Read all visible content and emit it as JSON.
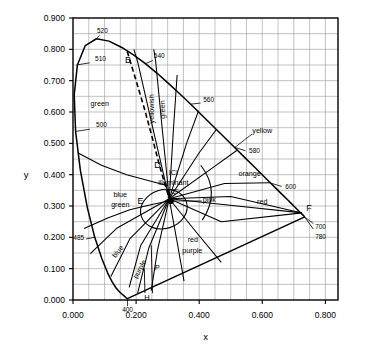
{
  "figure": {
    "kind": "cie-1931-chromaticity-diagram",
    "background": "#ffffff",
    "ink": "#000000",
    "grid_color": "#9a9a9a"
  },
  "axes": {
    "xlabel": "x",
    "ylabel": "y",
    "x_ticklabels": [
      "0.000",
      "0.200",
      "0.400",
      "0.600",
      "0.800"
    ],
    "x_tickvalues": [
      0.0,
      0.2,
      0.4,
      0.6,
      0.8
    ],
    "y_ticklabels": [
      "0.000",
      "0.100",
      "0.200",
      "0.300",
      "0.400",
      "0.500",
      "0.600",
      "0.700",
      "0.800",
      "0.900"
    ],
    "y_tickvalues": [
      0.0,
      0.1,
      0.2,
      0.3,
      0.4,
      0.5,
      0.6,
      0.7,
      0.8,
      0.9
    ],
    "xlim": [
      0.0,
      0.84
    ],
    "ylim": [
      0.0,
      0.9
    ],
    "grid_step": 0.05,
    "grid": true
  },
  "chart_data": {
    "type": "scatter",
    "title": "",
    "xlabel": "x",
    "ylabel": "y",
    "xlim": [
      0.0,
      0.84
    ],
    "ylim": [
      0.0,
      0.9
    ],
    "grid": true,
    "legend_position": "none",
    "spectral_locus": {
      "label": "spectral locus (monochromatic boundary)",
      "points": [
        [
          0.1741,
          0.005
        ],
        [
          0.174,
          0.005
        ],
        [
          0.1738,
          0.0049
        ],
        [
          0.1736,
          0.0049
        ],
        [
          0.1733,
          0.0048
        ],
        [
          0.173,
          0.0048
        ],
        [
          0.1726,
          0.0048
        ],
        [
          0.1721,
          0.0048
        ],
        [
          0.1714,
          0.0051
        ],
        [
          0.1703,
          0.0058
        ],
        [
          0.1689,
          0.0069
        ],
        [
          0.1669,
          0.0086
        ],
        [
          0.1644,
          0.0109
        ],
        [
          0.1611,
          0.0138
        ],
        [
          0.1566,
          0.0177
        ],
        [
          0.151,
          0.0227
        ],
        [
          0.144,
          0.0297
        ],
        [
          0.1355,
          0.0399
        ],
        [
          0.1241,
          0.0578
        ],
        [
          0.1096,
          0.0868
        ],
        [
          0.0913,
          0.1327
        ],
        [
          0.0687,
          0.2007
        ],
        [
          0.0454,
          0.295
        ],
        [
          0.0235,
          0.4127
        ],
        [
          0.0082,
          0.5384
        ],
        [
          0.0039,
          0.6548
        ],
        [
          0.0139,
          0.7502
        ],
        [
          0.0389,
          0.812
        ],
        [
          0.0743,
          0.8338
        ],
        [
          0.1142,
          0.8262
        ],
        [
          0.1547,
          0.8059
        ],
        [
          0.1929,
          0.7816
        ],
        [
          0.2296,
          0.7543
        ],
        [
          0.2658,
          0.7243
        ],
        [
          0.3016,
          0.6923
        ],
        [
          0.3373,
          0.6589
        ],
        [
          0.3731,
          0.6245
        ],
        [
          0.4087,
          0.5896
        ],
        [
          0.4441,
          0.5547
        ],
        [
          0.4788,
          0.5202
        ],
        [
          0.5125,
          0.4866
        ],
        [
          0.5448,
          0.4544
        ],
        [
          0.5752,
          0.4242
        ],
        [
          0.6029,
          0.3965
        ],
        [
          0.627,
          0.3725
        ],
        [
          0.6482,
          0.3514
        ],
        [
          0.6658,
          0.334
        ],
        [
          0.6801,
          0.3197
        ],
        [
          0.6915,
          0.3083
        ],
        [
          0.7006,
          0.2993
        ],
        [
          0.7079,
          0.292
        ],
        [
          0.714,
          0.2859
        ],
        [
          0.719,
          0.2809
        ],
        [
          0.723,
          0.277
        ],
        [
          0.726,
          0.274
        ],
        [
          0.7283,
          0.2717
        ],
        [
          0.73,
          0.27
        ],
        [
          0.7311,
          0.2689
        ],
        [
          0.732,
          0.268
        ],
        [
          0.7327,
          0.2673
        ],
        [
          0.7334,
          0.2666
        ],
        [
          0.734,
          0.266
        ],
        [
          0.7344,
          0.2656
        ],
        [
          0.7346,
          0.2654
        ]
      ]
    },
    "purple_line": {
      "label": "line of purples",
      "from": [
        0.7346,
        0.2654
      ],
      "to": [
        0.1741,
        0.005
      ]
    },
    "points": [
      {
        "name": "illuminant-C",
        "x": 0.31,
        "y": 0.316,
        "marker": "filled-dot",
        "label": "ICI illuminant \"C\""
      },
      {
        "name": "E",
        "x": 0.255,
        "y": 0.316,
        "label": "E"
      },
      {
        "name": "B",
        "x": 0.168,
        "y": 0.79,
        "label": "B"
      },
      {
        "name": "D",
        "x": 0.268,
        "y": 0.43,
        "label": "D"
      },
      {
        "name": "F",
        "x": 0.726,
        "y": 0.278,
        "label": "F"
      },
      {
        "name": "P",
        "x": 0.248,
        "y": 0.105,
        "label": "P"
      },
      {
        "name": "H",
        "x": 0.228,
        "y": 0.028,
        "label": "H"
      }
    ],
    "wavelength_ticks": [
      {
        "nm": "400",
        "x": 0.173,
        "y": 0.005,
        "anchor": "below"
      },
      {
        "nm": "485",
        "x": 0.069,
        "y": 0.2,
        "anchor": "left"
      },
      {
        "nm": "500",
        "x": 0.008,
        "y": 0.538,
        "anchor": "inside"
      },
      {
        "nm": "510",
        "x": 0.011,
        "y": 0.75,
        "anchor": "inside"
      },
      {
        "nm": "520",
        "x": 0.074,
        "y": 0.834,
        "anchor": "above"
      },
      {
        "nm": "540",
        "x": 0.229,
        "y": 0.754,
        "anchor": "right"
      },
      {
        "nm": "560",
        "x": 0.373,
        "y": 0.625,
        "anchor": "right"
      },
      {
        "nm": "580",
        "x": 0.512,
        "y": 0.487,
        "anchor": "right"
      },
      {
        "nm": "600",
        "x": 0.627,
        "y": 0.373,
        "anchor": "right"
      },
      {
        "nm": "700",
        "x": 0.734,
        "y": 0.265,
        "anchor": "right-below"
      },
      {
        "nm": "780",
        "x": 0.734,
        "y": 0.265,
        "anchor": "right-below2"
      }
    ],
    "color_name_regions": [
      {
        "name": "green",
        "label": "green",
        "x": 0.085,
        "y": 0.62,
        "rotate": 0
      },
      {
        "name": "yellowish-green",
        "label": "yellowish",
        "x": 0.258,
        "y": 0.61,
        "rotate": -90
      },
      {
        "name": "yellowish-green-2",
        "label": "green",
        "x": 0.292,
        "y": 0.608,
        "rotate": -90
      },
      {
        "name": "yellow",
        "label": "yellow",
        "x": 0.6,
        "y": 0.533,
        "rotate": 0
      },
      {
        "name": "orange",
        "label": "orange",
        "x": 0.56,
        "y": 0.395,
        "rotate": 0
      },
      {
        "name": "red",
        "label": "red",
        "x": 0.6,
        "y": 0.305,
        "rotate": 0
      },
      {
        "name": "pink",
        "label": "pink",
        "x": 0.432,
        "y": 0.312,
        "rotate": 0
      },
      {
        "name": "red-purple",
        "label": "red",
        "x": 0.38,
        "y": 0.185,
        "rotate": 0
      },
      {
        "name": "red-purple-2",
        "label": "purple",
        "x": 0.378,
        "y": 0.15,
        "rotate": 0
      },
      {
        "name": "purple",
        "label": "purple",
        "x": 0.218,
        "y": 0.095,
        "rotate": -62
      },
      {
        "name": "blue",
        "label": "blue",
        "x": 0.148,
        "y": 0.15,
        "rotate": -52
      },
      {
        "name": "blue-green",
        "label": "blue",
        "x": 0.15,
        "y": 0.33,
        "rotate": 0
      },
      {
        "name": "blue-green-2",
        "label": "green",
        "x": 0.15,
        "y": 0.297,
        "rotate": 0
      },
      {
        "name": "ici-c-1",
        "label": "ICI",
        "x": 0.318,
        "y": 0.4,
        "rotate": 0
      },
      {
        "name": "ici-c-2",
        "label": "illuminant",
        "x": 0.318,
        "y": 0.368,
        "rotate": 0
      },
      {
        "name": "ici-c-3",
        "label": "\"C\"",
        "x": 0.318,
        "y": 0.338,
        "rotate": 0
      }
    ],
    "planckian_locus": {
      "label": "dashed locus B to illuminant region",
      "style": "dashed",
      "points": [
        [
          0.172,
          0.793
        ],
        [
          0.2,
          0.7
        ],
        [
          0.228,
          0.605
        ],
        [
          0.252,
          0.515
        ],
        [
          0.274,
          0.43
        ],
        [
          0.292,
          0.368
        ],
        [
          0.303,
          0.33
        ]
      ]
    }
  },
  "icons": {
    "illuminant_marker": "filled-dot-icon"
  }
}
